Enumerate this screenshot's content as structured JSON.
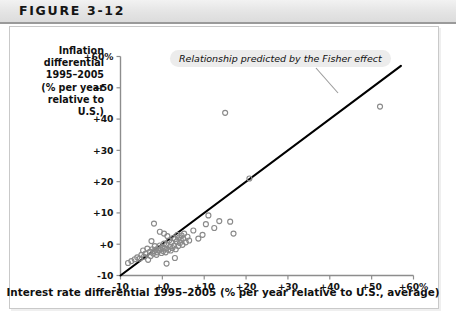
{
  "figure": {
    "title": "FIGURE 3-12"
  },
  "axes": {
    "y_title_lines": [
      "Inflation",
      "differential",
      "1995–2005",
      "(% per year",
      "relative to",
      "U.S.)"
    ],
    "x_title": "Interest rate differential 1995–2005 (% per year relative to U.S., average)"
  },
  "annotation": {
    "text": "Relationship predicted by the Fisher effect"
  },
  "ticks": {
    "y": [
      "+60%",
      "+50",
      "+40",
      "+30",
      "+20",
      "+10",
      "+0",
      "-10"
    ],
    "x": [
      "-10",
      "+0",
      "+10",
      "+20",
      "+30",
      "+40",
      "+50",
      "+60%"
    ]
  },
  "colors": {
    "header_band": "#e8e8e8",
    "axis": "#8d8d8d",
    "marker_stroke": "#8a8a8a",
    "line": "#000000",
    "annotation_bg": "#ececec",
    "text": "#101010"
  },
  "chart_data": {
    "type": "scatter",
    "title": "FIGURE 3-12",
    "xlabel": "Interest rate differential 1995–2005 (% per year relative to U.S., average)",
    "ylabel": "Inflation differential 1995–2005 (% per year relative to U.S.)",
    "xlim": [
      -10,
      60
    ],
    "ylim": [
      -10,
      60
    ],
    "xticks": [
      -10,
      0,
      10,
      20,
      30,
      40,
      50,
      60
    ],
    "yticks": [
      -10,
      0,
      10,
      20,
      30,
      40,
      50,
      60
    ],
    "grid": false,
    "legend": false,
    "reference_line": {
      "label": "Relationship predicted by the Fisher effect",
      "slope": 1,
      "intercept": 0,
      "x_start": -10,
      "x_end": 57
    },
    "points": [
      [
        -8.2,
        -6.0
      ],
      [
        -7.4,
        -5.4
      ],
      [
        -6.6,
        -4.8
      ],
      [
        -6.0,
        -4.2
      ],
      [
        -5.4,
        -4.6
      ],
      [
        -5.0,
        -3.4
      ],
      [
        -4.6,
        -2.0
      ],
      [
        -4.4,
        -4.0
      ],
      [
        -4.0,
        -3.0
      ],
      [
        -3.6,
        -1.4
      ],
      [
        -3.4,
        -5.0
      ],
      [
        -3.0,
        -2.4
      ],
      [
        -2.8,
        -3.8
      ],
      [
        -2.6,
        1.0
      ],
      [
        -2.4,
        -1.6
      ],
      [
        -2.2,
        -3.0
      ],
      [
        -2.0,
        -2.2
      ],
      [
        -1.8,
        -0.6
      ],
      [
        -1.6,
        -1.8
      ],
      [
        -1.4,
        -3.4
      ],
      [
        -1.2,
        -2.6
      ],
      [
        -1.0,
        -1.2
      ],
      [
        -0.8,
        -2.0
      ],
      [
        -0.6,
        -0.4
      ],
      [
        -0.4,
        -1.6
      ],
      [
        -0.2,
        -2.8
      ],
      [
        0.0,
        -1.0
      ],
      [
        0.2,
        -2.2
      ],
      [
        0.4,
        0.2
      ],
      [
        0.6,
        -1.4
      ],
      [
        0.8,
        -2.6
      ],
      [
        1.0,
        -0.2
      ],
      [
        1.2,
        2.6
      ],
      [
        1.4,
        -1.8
      ],
      [
        1.6,
        1.2
      ],
      [
        1.8,
        -0.8
      ],
      [
        2.0,
        -2.0
      ],
      [
        2.2,
        0.6
      ],
      [
        2.4,
        -1.2
      ],
      [
        2.6,
        2.0
      ],
      [
        2.8,
        -0.4
      ],
      [
        3.0,
        1.6
      ],
      [
        3.2,
        -1.6
      ],
      [
        3.4,
        0.8
      ],
      [
        3.6,
        3.0
      ],
      [
        3.8,
        -0.6
      ],
      [
        4.0,
        2.2
      ],
      [
        4.2,
        0.4
      ],
      [
        4.4,
        1.4
      ],
      [
        4.6,
        2.8
      ],
      [
        4.8,
        -0.2
      ],
      [
        5.0,
        1.8
      ],
      [
        5.2,
        3.4
      ],
      [
        5.6,
        0.6
      ],
      [
        6.0,
        2.4
      ],
      [
        6.4,
        1.2
      ],
      [
        -2.0,
        6.6
      ],
      [
        -0.6,
        4.0
      ],
      [
        0.4,
        3.4
      ],
      [
        1.0,
        -6.2
      ],
      [
        3.0,
        -4.4
      ],
      [
        7.4,
        4.4
      ],
      [
        8.6,
        1.8
      ],
      [
        9.6,
        3.0
      ],
      [
        10.4,
        6.4
      ],
      [
        11.0,
        9.2
      ],
      [
        12.4,
        5.2
      ],
      [
        13.6,
        7.4
      ],
      [
        16.2,
        7.2
      ],
      [
        17.0,
        3.4
      ],
      [
        15.0,
        42.0
      ],
      [
        20.8,
        21.0
      ],
      [
        52.0,
        44.0
      ]
    ]
  }
}
